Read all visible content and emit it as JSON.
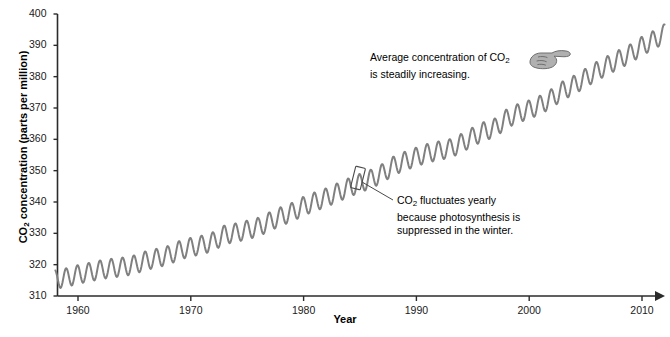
{
  "chart_data": {
    "type": "line",
    "title": "",
    "xlabel": "Year",
    "ylabel": "CO2 concentration (parts per million)",
    "ylabel_parts": {
      "pre": "CO",
      "sub": "2",
      "post": " concentration (parts per million)"
    },
    "xlim": [
      1958,
      2012
    ],
    "ylim": [
      310,
      400
    ],
    "ytick_values": [
      310,
      320,
      330,
      340,
      350,
      360,
      370,
      380,
      390,
      400
    ],
    "xtick_values": [
      1960,
      1970,
      1980,
      1990,
      2000,
      2010
    ],
    "grid": false,
    "legend": "none",
    "series_name": "Mauna Loa atmospheric CO2 (Keeling curve)",
    "line_color": "#808080",
    "axis_color": "#2b2b2b",
    "seasonal_amplitude": 3.0,
    "x": [
      1958,
      1959,
      1960,
      1961,
      1962,
      1963,
      1964,
      1965,
      1966,
      1967,
      1968,
      1969,
      1970,
      1971,
      1972,
      1973,
      1974,
      1975,
      1976,
      1977,
      1978,
      1979,
      1980,
      1981,
      1982,
      1983,
      1984,
      1985,
      1986,
      1987,
      1988,
      1989,
      1990,
      1991,
      1992,
      1993,
      1994,
      1995,
      1996,
      1997,
      1998,
      1999,
      2000,
      2001,
      2002,
      2003,
      2004,
      2005,
      2006,
      2007,
      2008,
      2009,
      2010,
      2011,
      2012
    ],
    "values": [
      315.3,
      315.9,
      316.9,
      317.6,
      318.4,
      318.9,
      319.3,
      320.0,
      321.3,
      322.1,
      323.0,
      324.6,
      325.6,
      326.3,
      327.4,
      329.6,
      330.2,
      331.1,
      332.0,
      333.8,
      335.4,
      336.8,
      338.7,
      340.1,
      341.4,
      343.0,
      344.6,
      346.0,
      347.4,
      349.2,
      351.6,
      353.1,
      354.4,
      355.6,
      356.4,
      357.1,
      358.8,
      360.8,
      362.6,
      363.7,
      366.6,
      368.3,
      369.5,
      371.0,
      373.1,
      375.6,
      377.4,
      379.6,
      381.8,
      383.7,
      385.6,
      387.4,
      389.8,
      391.6,
      393.8
    ]
  },
  "annotations": {
    "top": {
      "line1_pre": "Average concentration of CO",
      "line1_sub": "2",
      "line2": "is steadily increasing.",
      "icon": "pointing-hand-icon"
    },
    "bottom": {
      "line1_pre": "CO",
      "line1_sub": "2",
      "line1_post": " fluctuates yearly",
      "line2": "because photosynthesis is",
      "line3": "suppressed in the winter."
    }
  }
}
